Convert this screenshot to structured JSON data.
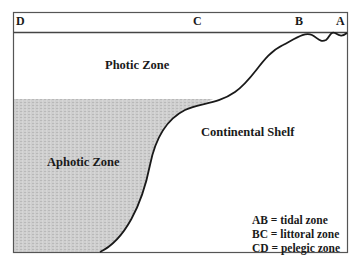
{
  "diagram": {
    "type": "ocean-zone-cross-section",
    "points": {
      "D": "D",
      "C": "C",
      "B": "B",
      "A": "A"
    },
    "zones": {
      "photic": "Photic Zone",
      "aphotic": "Aphotic Zone",
      "shelf": "Continental Shelf"
    },
    "legend": [
      "AB = tidal zone",
      "BC = littoral zone",
      "CD = pelegic zone"
    ],
    "colors": {
      "frame": "#555555",
      "curve": "#1a1a1a",
      "aphotic_fill": "#c8c8c8"
    }
  }
}
